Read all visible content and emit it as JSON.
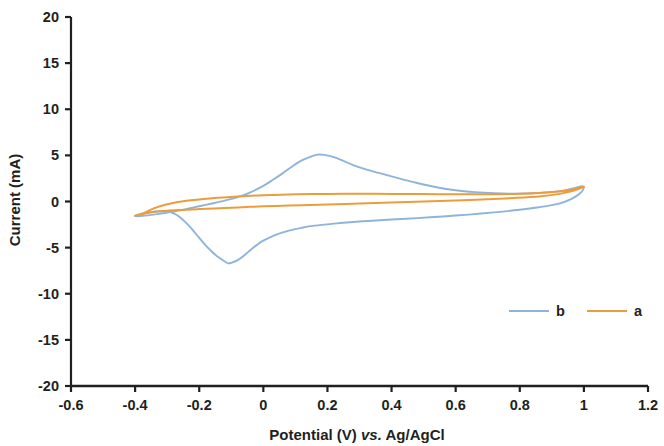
{
  "chart_data": {
    "type": "line",
    "title": "",
    "xlabel": "Potential (V) vs. Ag/AgCl",
    "xlabel_parts": {
      "pre": "Potential (V) ",
      "italic": "vs.",
      "post": " Ag/AgCl"
    },
    "ylabel": "Current (mA)",
    "xlim": [
      -0.6,
      1.2
    ],
    "ylim": [
      -20,
      20
    ],
    "xticks": [
      -0.6,
      -0.4,
      -0.2,
      0,
      0.2,
      0.4,
      0.6,
      0.8,
      1,
      1.2
    ],
    "xticklabels": [
      "-0.6",
      "-0.4",
      "-0.2",
      "0",
      "0.2",
      "0.4",
      "0.6",
      "0.8",
      "1",
      "1.2"
    ],
    "yticks": [
      20,
      15,
      10,
      5,
      0,
      -5,
      -10,
      -15,
      -20
    ],
    "yticklabels": [
      "20",
      "15",
      "10",
      "5",
      "0",
      "-5",
      "-10",
      "-15",
      "-20"
    ],
    "grid": false,
    "legend_position": "inside-lower-right",
    "series": [
      {
        "name": "b",
        "color": "#8FB4DC",
        "width": 1.9,
        "points": [
          [
            -0.4,
            -1.55
          ],
          [
            -0.38,
            -1.35
          ],
          [
            -0.36,
            -1.2
          ],
          [
            -0.33,
            -1.08
          ],
          [
            -0.3,
            -1.1
          ],
          [
            -0.28,
            -1.28
          ],
          [
            -0.26,
            -1.7
          ],
          [
            -0.24,
            -2.35
          ],
          [
            -0.22,
            -3.1
          ],
          [
            -0.2,
            -3.95
          ],
          [
            -0.18,
            -4.75
          ],
          [
            -0.16,
            -5.45
          ],
          [
            -0.14,
            -6.05
          ],
          [
            -0.12,
            -6.5
          ],
          [
            -0.11,
            -6.7
          ],
          [
            -0.1,
            -6.65
          ],
          [
            -0.08,
            -6.35
          ],
          [
            -0.06,
            -5.85
          ],
          [
            -0.04,
            -5.25
          ],
          [
            -0.02,
            -4.7
          ],
          [
            0.0,
            -4.25
          ],
          [
            0.04,
            -3.6
          ],
          [
            0.08,
            -3.15
          ],
          [
            0.12,
            -2.85
          ],
          [
            0.16,
            -2.62
          ],
          [
            0.22,
            -2.4
          ],
          [
            0.28,
            -2.22
          ],
          [
            0.34,
            -2.08
          ],
          [
            0.4,
            -1.95
          ],
          [
            0.48,
            -1.8
          ],
          [
            0.56,
            -1.62
          ],
          [
            0.64,
            -1.42
          ],
          [
            0.72,
            -1.18
          ],
          [
            0.8,
            -0.9
          ],
          [
            0.86,
            -0.62
          ],
          [
            0.92,
            -0.25
          ],
          [
            0.96,
            0.25
          ],
          [
            0.99,
            0.95
          ],
          [
            1.0,
            1.55
          ],
          [
            0.99,
            1.62
          ],
          [
            0.97,
            1.45
          ],
          [
            0.94,
            1.2
          ],
          [
            0.9,
            1.02
          ],
          [
            0.84,
            0.9
          ],
          [
            0.78,
            0.85
          ],
          [
            0.72,
            0.9
          ],
          [
            0.66,
            1.02
          ],
          [
            0.6,
            1.22
          ],
          [
            0.54,
            1.55
          ],
          [
            0.48,
            2.0
          ],
          [
            0.44,
            2.35
          ],
          [
            0.4,
            2.72
          ],
          [
            0.36,
            3.1
          ],
          [
            0.32,
            3.48
          ],
          [
            0.28,
            3.95
          ],
          [
            0.25,
            4.4
          ],
          [
            0.22,
            4.82
          ],
          [
            0.19,
            5.05
          ],
          [
            0.17,
            5.08
          ],
          [
            0.15,
            4.9
          ],
          [
            0.12,
            4.45
          ],
          [
            0.09,
            3.8
          ],
          [
            0.06,
            3.05
          ],
          [
            0.03,
            2.35
          ],
          [
            0.0,
            1.7
          ],
          [
            -0.04,
            1.0
          ],
          [
            -0.08,
            0.48
          ],
          [
            -0.12,
            0.1
          ],
          [
            -0.16,
            -0.22
          ],
          [
            -0.2,
            -0.52
          ],
          [
            -0.24,
            -0.82
          ],
          [
            -0.28,
            -1.08
          ],
          [
            -0.32,
            -1.32
          ],
          [
            -0.36,
            -1.5
          ],
          [
            -0.39,
            -1.6
          ],
          [
            -0.4,
            -1.58
          ]
        ]
      },
      {
        "name": "a",
        "color": "#ED9C3C",
        "width": 2.0,
        "points": [
          [
            -0.4,
            -1.55
          ],
          [
            -0.37,
            -1.3
          ],
          [
            -0.34,
            -1.12
          ],
          [
            -0.3,
            -1.0
          ],
          [
            -0.26,
            -0.92
          ],
          [
            -0.2,
            -0.82
          ],
          [
            -0.12,
            -0.7
          ],
          [
            -0.04,
            -0.58
          ],
          [
            0.04,
            -0.48
          ],
          [
            0.12,
            -0.4
          ],
          [
            0.2,
            -0.32
          ],
          [
            0.3,
            -0.22
          ],
          [
            0.4,
            -0.12
          ],
          [
            0.5,
            0.0
          ],
          [
            0.6,
            0.12
          ],
          [
            0.7,
            0.25
          ],
          [
            0.78,
            0.38
          ],
          [
            0.86,
            0.55
          ],
          [
            0.92,
            0.8
          ],
          [
            0.96,
            1.1
          ],
          [
            0.99,
            1.45
          ],
          [
            1.0,
            1.6
          ],
          [
            0.99,
            1.55
          ],
          [
            0.96,
            1.28
          ],
          [
            0.92,
            1.08
          ],
          [
            0.86,
            0.92
          ],
          [
            0.78,
            0.82
          ],
          [
            0.7,
            0.78
          ],
          [
            0.6,
            0.78
          ],
          [
            0.5,
            0.8
          ],
          [
            0.4,
            0.82
          ],
          [
            0.3,
            0.84
          ],
          [
            0.2,
            0.82
          ],
          [
            0.1,
            0.78
          ],
          [
            0.0,
            0.68
          ],
          [
            -0.08,
            0.55
          ],
          [
            -0.16,
            0.36
          ],
          [
            -0.24,
            0.08
          ],
          [
            -0.3,
            -0.3
          ],
          [
            -0.34,
            -0.72
          ],
          [
            -0.37,
            -1.2
          ],
          [
            -0.4,
            -1.55
          ]
        ]
      }
    ],
    "legend": [
      {
        "label": "b",
        "color": "#8FB4DC"
      },
      {
        "label": "a",
        "color": "#ED9C3C"
      }
    ]
  }
}
